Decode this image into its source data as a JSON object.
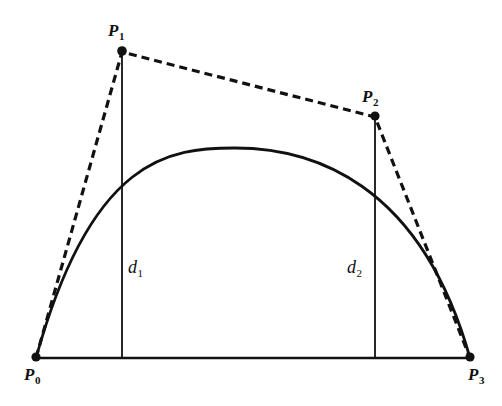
{
  "figure": {
    "background_color": "#ffffff",
    "stroke_color": "#111111",
    "width": 502,
    "height": 406
  },
  "labels": {
    "p0": {
      "base": "P",
      "sub": "0",
      "x": 24,
      "y": 366
    },
    "p1": {
      "base": "P",
      "sub": "1",
      "x": 108,
      "y": 22
    },
    "p2": {
      "base": "P",
      "sub": "2",
      "x": 362,
      "y": 88
    },
    "p3": {
      "base": "P",
      "sub": "3",
      "x": 468,
      "y": 366
    },
    "d1": {
      "base": "d",
      "sub": "1",
      "x": 128,
      "y": 258
    },
    "d2": {
      "base": "d",
      "sub": "2",
      "x": 347,
      "y": 258
    }
  },
  "chart_data": {
    "type": "line",
    "xlabel": "",
    "ylabel": "",
    "xlim": [
      0,
      502
    ],
    "ylim": [
      406,
      0
    ],
    "grid": false,
    "legend": false,
    "control_points": [
      {
        "name": "P0",
        "x": 36,
        "y": 358
      },
      {
        "name": "P1",
        "x": 122,
        "y": 52
      },
      {
        "name": "P2",
        "x": 375,
        "y": 117
      },
      {
        "name": "P3",
        "x": 470,
        "y": 358
      }
    ],
    "series": [
      {
        "name": "bezier-curve",
        "style": "solid",
        "type": "cubic-bezier",
        "points": [
          {
            "x": 36,
            "y": 358
          },
          {
            "x": 122,
            "y": 190
          },
          {
            "x": 235,
            "y": 148
          },
          {
            "x": 375,
            "y": 208
          },
          {
            "x": 470,
            "y": 358
          }
        ]
      },
      {
        "name": "control-polygon",
        "style": "dashed",
        "points": [
          {
            "x": 36,
            "y": 358
          },
          {
            "x": 122,
            "y": 52
          },
          {
            "x": 375,
            "y": 117
          },
          {
            "x": 470,
            "y": 358
          }
        ]
      },
      {
        "name": "baseline-chord",
        "style": "solid",
        "points": [
          {
            "x": 36,
            "y": 358
          },
          {
            "x": 470,
            "y": 358
          }
        ]
      },
      {
        "name": "distance-line-d1",
        "style": "solid",
        "points": [
          {
            "x": 122,
            "y": 52
          },
          {
            "x": 122,
            "y": 358
          }
        ]
      },
      {
        "name": "distance-line-d2",
        "style": "solid",
        "points": [
          {
            "x": 375,
            "y": 117
          },
          {
            "x": 375,
            "y": 358
          }
        ]
      }
    ],
    "annotations": [
      {
        "text": "P0",
        "x": 24,
        "y": 366
      },
      {
        "text": "P1",
        "x": 108,
        "y": 22
      },
      {
        "text": "P2",
        "x": 362,
        "y": 88
      },
      {
        "text": "P3",
        "x": 468,
        "y": 366
      },
      {
        "text": "d1",
        "x": 128,
        "y": 258
      },
      {
        "text": "d2",
        "x": 347,
        "y": 258
      }
    ]
  }
}
